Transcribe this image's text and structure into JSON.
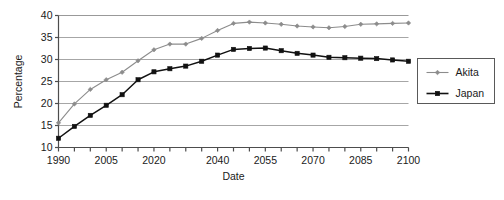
{
  "chart_data": {
    "type": "line",
    "title": "",
    "xlabel": "Date",
    "ylabel": "Percentage",
    "xlim": [
      1990,
      2100
    ],
    "ylim": [
      10,
      40
    ],
    "yticks": [
      10,
      15,
      20,
      25,
      30,
      35,
      40
    ],
    "ytick_labels": [
      "10",
      "15",
      "20",
      "25",
      "30",
      "35",
      "40"
    ],
    "x": [
      1990,
      1995,
      2000,
      2005,
      2010,
      2015,
      2020,
      2025,
      2030,
      2035,
      2040,
      2045,
      2050,
      2055,
      2060,
      2065,
      2070,
      2075,
      2080,
      2085,
      2090,
      2095,
      2100
    ],
    "xtick_labels": [
      "1990",
      "",
      "",
      "2005",
      "",
      "",
      "2020",
      "",
      "",
      "",
      "2040",
      "",
      "",
      "2055",
      "",
      "",
      "2070",
      "",
      "",
      "2085",
      "",
      "",
      "2100"
    ],
    "grid": "horizontal",
    "legend_position": "right",
    "series": [
      {
        "name": "Akita",
        "color": "#8c8c8c",
        "marker": "diamond",
        "values": [
          15.6,
          19.9,
          23.2,
          25.4,
          27.1,
          29.7,
          32.2,
          33.5,
          33.5,
          34.8,
          36.6,
          38.2,
          38.5,
          38.3,
          38.0,
          37.6,
          37.4,
          37.2,
          37.5,
          38.0,
          38.1,
          38.2,
          38.3
        ]
      },
      {
        "name": "Japan",
        "color": "#111111",
        "marker": "square",
        "values": [
          12.1,
          14.8,
          17.3,
          19.6,
          22.0,
          25.4,
          27.2,
          27.9,
          28.5,
          29.6,
          31.0,
          32.3,
          32.5,
          32.6,
          32.0,
          31.4,
          31.0,
          30.5,
          30.4,
          30.3,
          30.2,
          29.9,
          29.6
        ]
      }
    ],
    "legend_entries": [
      {
        "label": "Akita",
        "color": "#8c8c8c",
        "marker": "diamond"
      },
      {
        "label": "Japan",
        "color": "#111111",
        "marker": "square"
      }
    ]
  }
}
